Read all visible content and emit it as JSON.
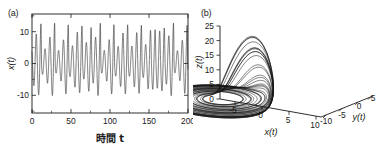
{
  "figure": {
    "background_color": "#ffffff",
    "line_color": "#1a1a1a",
    "panels": [
      {
        "label": "(a)",
        "name": "time-series-panel"
      },
      {
        "label": "(b)",
        "name": "phase-portrait-panel"
      }
    ]
  },
  "chart_data": [
    {
      "type": "line",
      "name": "time-series",
      "title": "(a)",
      "xlabel": "時間 t",
      "xlabel_plain": "jikan t",
      "ylabel": "x(t)",
      "xlim": [
        0,
        200
      ],
      "ylim": [
        -14,
        14
      ],
      "xticks": [
        0,
        50,
        100,
        150,
        200
      ],
      "xticklabels": [
        "0",
        "50",
        "100",
        "150",
        "200"
      ],
      "yticks": [
        -10,
        0,
        10
      ],
      "yticklabels": [
        "-10",
        "0",
        "10"
      ],
      "grid": false,
      "legend": null,
      "system": "Roessler",
      "series": [
        {
          "name": "x(t)",
          "color": "#2a2a2a",
          "description": "chaotic oscillation, irregular amplitude between about -10 and +12, roughly 36 peaks over t = 0 to 200"
        }
      ]
    },
    {
      "type": "line",
      "name": "phase-portrait-3d",
      "title": "(b)",
      "xlabel": "x(t)",
      "ylabel": "y(t)",
      "zlabel": "z(t)",
      "xlim": [
        -10,
        13
      ],
      "ylim": [
        -12,
        8
      ],
      "zlim": [
        0,
        27
      ],
      "xticks": [
        -5,
        0,
        5,
        10
      ],
      "xticklabels": [
        "-5",
        "0",
        "5",
        "10"
      ],
      "yticks": [
        -10,
        -5,
        0,
        5
      ],
      "yticklabels": [
        "-10",
        "-5",
        "0",
        "5"
      ],
      "zticks": [
        0,
        5,
        10,
        15,
        20,
        25
      ],
      "zticklabels": [
        "0",
        "5",
        "10",
        "15",
        "20",
        "25"
      ],
      "grid": false,
      "legend": null,
      "projection": "3d",
      "series": [
        {
          "name": "trajectory",
          "color": "#141414",
          "description": "Roessler attractor: flat spiral disk in the z near 0 plane with a folded vertical sheet rising to z of about 26"
        }
      ]
    }
  ]
}
